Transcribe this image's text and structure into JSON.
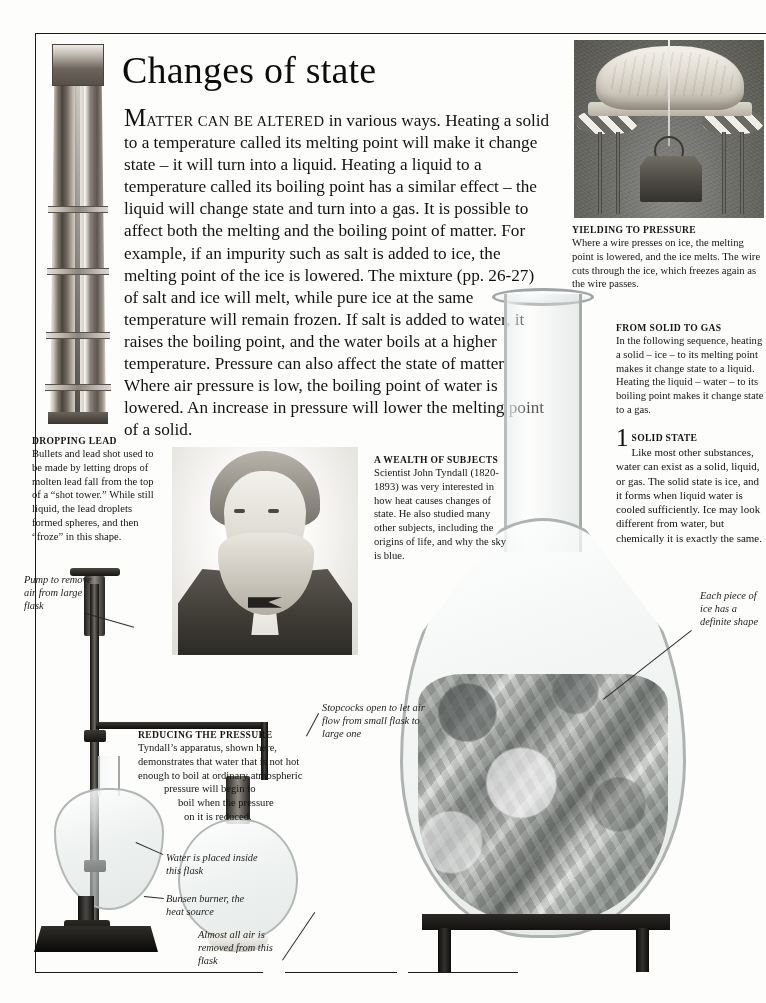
{
  "page": {
    "title": "Changes of state",
    "intro": {
      "leadcap": "M",
      "smallcaps": "ATTER CAN BE ALTERED",
      "rest": " in various ways. Heating a solid to a temperature called its melting point will make it change state – it will turn into a liquid. Heating a liquid to a temperature called its boiling point has a similar effect – the liquid will change state and turn into a gas. It is possible to affect both the melting and the boiling point of matter. For example, if an impurity such as salt is added to ice, the melting point of the ice is lowered. The mixture (pp. 26-27) of salt and ice will melt, while pure ice at the same temperature will remain frozen. If salt is added to water, it raises the boiling point, and the water boils at a higher temperature. Pressure can also affect the state of matter. Where air pressure is low, the boiling point of water is lowered. An increase in pressure will lower the melting point of a solid."
    }
  },
  "captions": {
    "yielding_to_pressure": {
      "head": "YIELDING TO PRESSURE",
      "body": "Where a wire presses on ice, the melting point is lowered, and the ice melts. The wire cuts through the ice, which freezes again as the wire passes."
    },
    "from_solid_to_gas": {
      "head": "FROM SOLID TO GAS",
      "body": "In the following sequence, heating a solid – ice – to its melting point makes it change state to a liquid. Heating the liquid – water – to its boiling point makes it change state to a gas."
    },
    "dropping_lead": {
      "head": "DROPPING LEAD",
      "body": "Bullets and lead shot used to be made by letting drops of molten lead fall from the top of a “shot tower.” While still liquid, the lead droplets formed spheres, and then “froze” in this shape."
    },
    "wealth_of_subjects": {
      "head": "A WEALTH OF SUBJECTS",
      "body": "Scientist John Tyndall (1820-1893) was very interested in how heat causes changes of state. He also studied many other subjects, including the origins of life, and why the sky is blue."
    },
    "reducing_the_pressure": {
      "head": "REDUCING THE PRESSURE",
      "line1": "Tyndall’s apparatus, shown",
      "line2": "here, demonstrates that water",
      "line3": "that is not hot enough to boil",
      "line4": "at ordinary atmospheric",
      "line5": "pressure will begin to",
      "line6": "boil when the pressure",
      "line7": "on it is reduced."
    }
  },
  "steps": [
    {
      "number": "1",
      "head": "SOLID STATE",
      "body": "Like most other substances, water can exist as a solid, liquid, or gas. The solid state is ice, and it forms when liquid water is cooled sufficiently. Ice may look different from water, but chemically it is exactly the same."
    }
  ],
  "annotations": {
    "pump": "Pump to remove air from large flask",
    "stopcocks": "Stopcocks open to let air flow from small flask to large one",
    "water_placed": "Water is placed inside this flask",
    "bunsen": "Bunsen burner, the heat source",
    "almost_all_air": "Almost all air is removed from this flask",
    "each_piece": "Each piece of ice has a definite shape"
  },
  "figures": {
    "shot_tower": "shot-tower-engraving",
    "wire_through_ice": "wire-through-ice-photograph",
    "tyndall_portrait": "john-tyndall-portrait",
    "ice_flask": "flask-of-ice-photograph",
    "tyndall_apparatus": "tyndall-vacuum-apparatus"
  },
  "colors": {
    "ink": "#121212",
    "paper": "#fdfdfb",
    "rule": "#1a1a1a"
  }
}
